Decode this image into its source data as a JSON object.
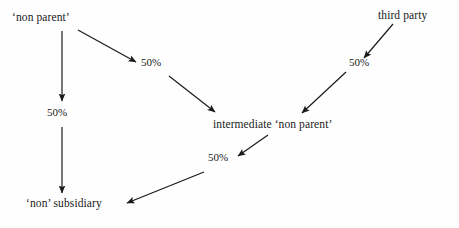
{
  "diagram": {
    "background_color": "#ffffff",
    "line_color": "#1a1a1a",
    "text_color": "#1a1a1a",
    "nodes": [
      {
        "id": "non_parent",
        "label": "‘non parent’"
      },
      {
        "id": "third_party",
        "label": "third party"
      },
      {
        "id": "intermediate",
        "label": "intermediate ‘non parent’"
      },
      {
        "id": "non_subsidiary",
        "label": "‘non’ subsidiary"
      }
    ],
    "edges": [
      {
        "id": "np_to_int",
        "from": "non_parent",
        "to": "intermediate",
        "label": "50%"
      },
      {
        "id": "np_to_sub",
        "from": "non_parent",
        "to": "non_subsidiary",
        "label": "50%"
      },
      {
        "id": "tp_to_int",
        "from": "third_party",
        "to": "intermediate",
        "label": "50%"
      },
      {
        "id": "int_to_sub",
        "from": "intermediate",
        "to": "non_subsidiary",
        "label": "50%"
      }
    ]
  }
}
